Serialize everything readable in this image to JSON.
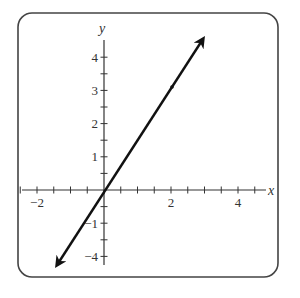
{
  "chart_data": {
    "type": "line",
    "title": "",
    "xlabel": "x",
    "ylabel": "y",
    "xlim": [
      -2.5,
      5
    ],
    "ylim": [
      -4.5,
      4.5
    ],
    "x_tick_step": 0.5,
    "y_tick_step": 0.5,
    "x_tick_labels": [
      {
        "value": -2,
        "label": "−2"
      },
      {
        "value": 2,
        "label": "2"
      },
      {
        "value": 4,
        "label": "4"
      }
    ],
    "y_tick_labels": [
      {
        "value": 4,
        "label": "4"
      },
      {
        "value": 3,
        "label": "3"
      },
      {
        "value": 2,
        "label": "2"
      },
      {
        "value": 1,
        "label": "1"
      },
      {
        "value": -1,
        "label": "−1"
      },
      {
        "value": -2,
        "label": "−4"
      }
    ],
    "series": [
      {
        "name": "line",
        "kind": "line with arrows at both ends",
        "x": [
          -1.4,
          0,
          2.0,
          3.0
        ],
        "y": [
          -2.3,
          0,
          3.0,
          4.6
        ],
        "marked_point": {
          "x": 2.0,
          "y": 3.0
        }
      }
    ],
    "grid": false,
    "frame": "rounded rectangle",
    "colors": {
      "line": "#111111",
      "axes": "#333333",
      "frame": "#444444"
    }
  }
}
